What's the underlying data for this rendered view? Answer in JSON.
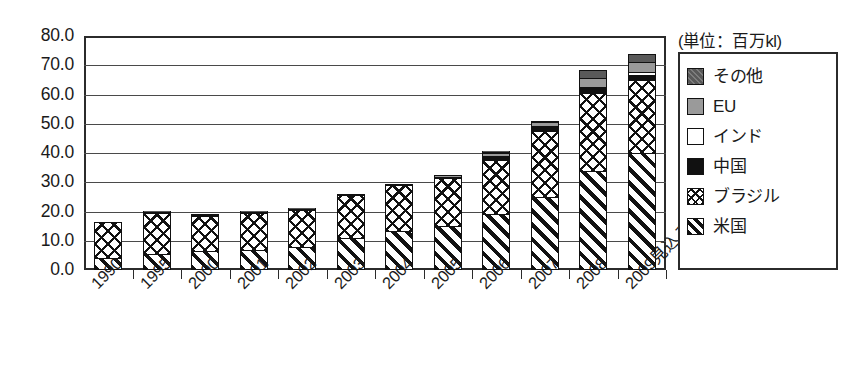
{
  "chart_data": {
    "type": "bar",
    "stacked": true,
    "title": "",
    "subtitle": "",
    "unit_note": "(単位：百万kl)",
    "xlabel": "",
    "ylabel": "",
    "ylim": [
      0,
      80
    ],
    "ytick_step": 10,
    "ytick_labels": [
      "80.0",
      "70.0",
      "60.0",
      "50.0",
      "40.0",
      "30.0",
      "20.0",
      "10.0",
      "0.0"
    ],
    "grid": true,
    "grid_axis": "y",
    "legend_position": "right-outside",
    "categories": [
      "1990",
      "1995",
      "2000",
      "2001",
      "2002",
      "2003",
      "2004",
      "2005",
      "2006",
      "2007",
      "2008",
      "2009見込み"
    ],
    "series": [
      {
        "name": "米国",
        "pattern": "diagonal-hatch",
        "color": "#ffffff",
        "values": [
          4.0,
          5.5,
          6.5,
          7.0,
          8.0,
          11.0,
          13.5,
          15.0,
          19.0,
          25.0,
          34.0,
          40.0
        ]
      },
      {
        "name": "ブラジル",
        "pattern": "cross-hatch",
        "color": "#ffffff",
        "values": [
          12.5,
          14.0,
          12.0,
          12.5,
          12.5,
          14.5,
          15.5,
          16.5,
          18.5,
          22.5,
          26.5,
          25.0
        ]
      },
      {
        "name": "中国",
        "pattern": "solid",
        "color": "#111111",
        "values": [
          0.0,
          0.0,
          0.0,
          0.0,
          0.0,
          0.0,
          0.0,
          0.4,
          1.0,
          1.3,
          1.6,
          1.8
        ]
      },
      {
        "name": "インド",
        "pattern": "solid",
        "color": "#ffffff",
        "values": [
          0.0,
          0.0,
          0.0,
          0.0,
          0.0,
          0.0,
          0.0,
          0.0,
          0.3,
          0.4,
          0.5,
          0.8
        ]
      },
      {
        "name": "EU",
        "pattern": "solid",
        "color": "#9a9a9a",
        "values": [
          0.0,
          0.2,
          0.2,
          0.2,
          0.2,
          0.3,
          0.4,
          0.5,
          1.0,
          1.5,
          2.9,
          3.4
        ]
      },
      {
        "name": "その他",
        "pattern": "solid",
        "color": "#595959",
        "values": [
          0.0,
          0.3,
          0.3,
          0.3,
          0.3,
          0.2,
          0.1,
          0.1,
          0.7,
          0.3,
          3.0,
          3.0
        ]
      }
    ],
    "totals": [
      16.5,
      20.0,
      19.0,
      20.0,
      21.0,
      26.0,
      29.5,
      32.5,
      40.5,
      51.0,
      68.5,
      74.0
    ]
  },
  "legend": {
    "unit_label": "(単位：百万kl)",
    "items": [
      {
        "label": "その他",
        "swatch": "other-swatch"
      },
      {
        "label": "EU",
        "swatch": "eu-swatch"
      },
      {
        "label": "インド",
        "swatch": "india-swatch"
      },
      {
        "label": "中国",
        "swatch": "china-swatch"
      },
      {
        "label": "ブラジル",
        "swatch": "brazil-swatch"
      },
      {
        "label": "米国",
        "swatch": "usa-swatch"
      }
    ]
  }
}
